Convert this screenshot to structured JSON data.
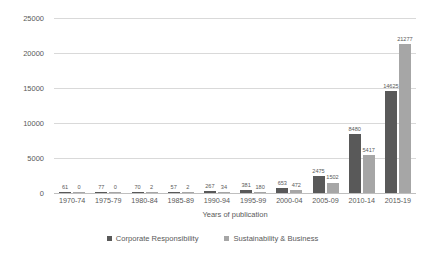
{
  "chart_data": {
    "type": "bar",
    "title": "",
    "xlabel": "Years of publication",
    "ylabel": "Number of WoS publications",
    "ylim": [
      0,
      25000
    ],
    "yticks": [
      0,
      5000,
      10000,
      15000,
      20000,
      25000
    ],
    "ytick_labels": [
      "0",
      "5000",
      "10000",
      "15000",
      "20000",
      "25000"
    ],
    "grid": "horizontal",
    "legend_position": "bottom",
    "categories": [
      "1970-74",
      "1975-79",
      "1980-84",
      "1985-89",
      "1990-94",
      "1995-99",
      "2000-04",
      "2005-09",
      "2010-14",
      "2015-19"
    ],
    "series": [
      {
        "name": "Corporate Responsibility",
        "color": "#595959",
        "values": [
          61,
          77,
          70,
          57,
          267,
          381,
          653,
          2475,
          8480,
          14625
        ],
        "labels": [
          "61",
          "77",
          "70",
          "57",
          "267",
          "381",
          "653",
          "2475",
          "8480",
          "14625"
        ]
      },
      {
        "name": "Sustainability & Business",
        "color": "#a6a6a6",
        "values": [
          0,
          0,
          2,
          2,
          34,
          180,
          472,
          1502,
          5417,
          21277
        ],
        "labels": [
          "0",
          "0",
          "2",
          "2",
          "34",
          "180",
          "472",
          "1502",
          "5417",
          "21277"
        ]
      }
    ]
  }
}
